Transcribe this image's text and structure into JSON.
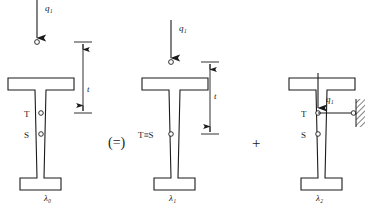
{
  "diagram": {
    "operators": [
      {
        "symbol": "(=)",
        "name": "equivalence-operator",
        "x": 120,
        "y": 143
      },
      {
        "symbol": "+",
        "name": "plus-operator",
        "x": 258,
        "y": 143
      }
    ],
    "figures": [
      {
        "id": "figure-0",
        "caption": "λ₀",
        "caption_x": 48,
        "caption_y": 199,
        "load": {
          "label": "q₁",
          "label_x": 45,
          "label_y": 11,
          "line_x": 37,
          "line_y1": 0,
          "line_y2": 38,
          "node_x": 37,
          "node_y": 42
        },
        "points": [
          {
            "label": "T",
            "label_x": 26,
            "label_y": 116,
            "cx": 41,
            "cy": 113
          },
          {
            "label": "S",
            "label_x": 26,
            "label_y": 137,
            "cx": 41,
            "cy": 134
          }
        ],
        "dimension": {
          "label": "t",
          "label_x": 92,
          "label_y": 92,
          "x": 83,
          "y_top": 42,
          "y_bottom": 113,
          "tick_half_width": 9
        },
        "support": null
      },
      {
        "id": "figure-1",
        "caption": "λ₁",
        "caption_x": 173,
        "caption_y": 199,
        "load": {
          "label": "q₁",
          "label_x": 180,
          "label_y": 31,
          "line_x": 171,
          "line_y1": 20,
          "line_y2": 58,
          "node_x": 171,
          "node_y": 62
        },
        "points": [
          {
            "label": "T≡S",
            "label_x": 139,
            "label_y": 137,
            "cx": 171,
            "cy": 134
          }
        ],
        "dimension": {
          "label": "t",
          "label_x": 215,
          "label_y": 97,
          "x": 210,
          "y_top": 62,
          "y_bottom": 134,
          "tick_half_width": 9
        },
        "support": null
      },
      {
        "id": "figure-2",
        "caption": "λ₂",
        "caption_x": 320,
        "caption_y": 199,
        "load": {
          "label": "q₁",
          "label_x": 327,
          "label_y": 100,
          "line_x": 318,
          "line_y1": 73,
          "line_y2": 108,
          "node_x": 318,
          "node_y": 113
        },
        "points": [
          {
            "label": "T",
            "label_x": 303,
            "label_y": 116,
            "cx": 318,
            "cy": 113
          },
          {
            "label": "S",
            "label_x": 303,
            "label_y": 137,
            "cx": 318,
            "cy": 134
          }
        ],
        "dimension": null,
        "support": {
          "type": "roller-link-to-wall",
          "link_x1": 318,
          "link_x2": 352,
          "link_y": 113,
          "pin_cx": 354,
          "pin_cy": 113,
          "wall_x": 357,
          "wall_y": 99,
          "wall_w": 9,
          "wall_h": 28
        }
      }
    ],
    "beam_geometry": {
      "note": "I-section with wide top flange, tapered web, narrow bottom flange",
      "top_flange_width": 66,
      "bottom_flange_width": 34,
      "top_y": 78,
      "bottom_y": 190
    },
    "colors": {
      "stroke": "#1a1a1a",
      "fill": "#ffffff",
      "background": "#ffffff"
    }
  }
}
